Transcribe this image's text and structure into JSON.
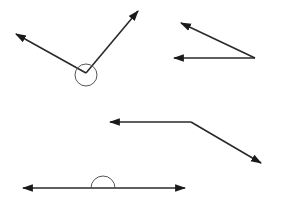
{
  "canvas": {
    "width": 284,
    "height": 208,
    "background": "#ffffff"
  },
  "style": {
    "stroke": "#2a2a2a",
    "arc_stroke": "#555555",
    "stroke_width": 1.6,
    "arrow_color": "#1a1a1a"
  },
  "angles": [
    {
      "id": "reflex-angle",
      "vertex": [
        86,
        73
      ],
      "rays": [
        [
          16,
          34
        ],
        [
          138,
          11
        ]
      ],
      "marker": {
        "type": "circle",
        "cx": 86,
        "cy": 75,
        "r": 11,
        "note": "reflex arc marking the outer angle"
      }
    },
    {
      "id": "acute-angle",
      "vertex": [
        255,
        58
      ],
      "rays": [
        [
          181,
          23
        ],
        [
          174,
          58
        ]
      ],
      "marker": null
    },
    {
      "id": "obtuse-angle",
      "vertex": [
        191,
        122
      ],
      "rays": [
        [
          110,
          122
        ],
        [
          261,
          163
        ]
      ],
      "marker": null
    },
    {
      "id": "straight-angle",
      "vertex": [
        103,
        188
      ],
      "rays": [
        [
          23,
          188
        ],
        [
          185,
          188
        ]
      ],
      "marker": {
        "type": "semicircle",
        "cx": 103,
        "cy": 188,
        "r": 12
      }
    }
  ]
}
